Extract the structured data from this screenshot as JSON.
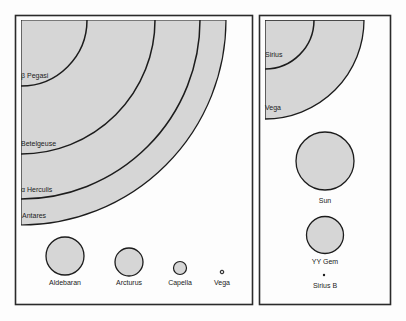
{
  "colors": {
    "fill": "#d6d6d6",
    "stroke": "#1c1c1c",
    "frame": "#2a2a2a",
    "background": "#fdfdfd"
  },
  "left_panel": {
    "giant_arcs": [
      {
        "name": "beta_pegasi",
        "label": "β Pegasi",
        "radius": 66
      },
      {
        "name": "betelgeuse",
        "label": "Betelgeuse",
        "radius": 134
      },
      {
        "name": "alpha_herculis",
        "label": "α Herculis",
        "radius": 179
      },
      {
        "name": "antares",
        "label": "Antares",
        "radius": 205
      }
    ],
    "stars": [
      {
        "name": "aldebaran",
        "label": "Aldebaran",
        "radius": 19
      },
      {
        "name": "arcturus",
        "label": "Arcturus",
        "radius": 14
      },
      {
        "name": "capella",
        "label": "Capella",
        "radius": 6.5
      },
      {
        "name": "vega",
        "label": "Vega",
        "radius": 2
      }
    ]
  },
  "right_panel": {
    "giant_arcs": [
      {
        "name": "sirius",
        "label": "Sirius",
        "radius": 49
      },
      {
        "name": "vega",
        "label": "Vega",
        "radius": 99
      }
    ],
    "stars": [
      {
        "name": "sun",
        "label": "Sun",
        "radius": 29
      },
      {
        "name": "yy_gem",
        "label": "YY Gem",
        "radius": 18.5
      },
      {
        "name": "sirius_b",
        "label": "Sirius B",
        "radius": 1.2
      }
    ]
  }
}
